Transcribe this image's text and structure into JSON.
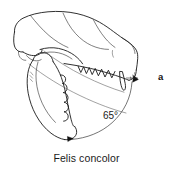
{
  "figure": {
    "panel_label": "a",
    "caption": "Felis concolor",
    "angle_label": "65°",
    "angle_value": 65,
    "angle_unit": "degrees",
    "colors": {
      "background": "#ffffff",
      "ink": "#1a1a1a",
      "ink_light": "#555555",
      "arc": "#3a3a3a",
      "text": "#1a1a1a"
    },
    "parts": [
      {
        "name": "cranium",
        "label": "cranium"
      },
      {
        "name": "rostrum",
        "label": "rostrum"
      },
      {
        "name": "upper-tooth-row",
        "label": "upper tooth row"
      },
      {
        "name": "upper-canine",
        "label": "upper canine"
      },
      {
        "name": "mandible",
        "label": "mandible"
      },
      {
        "name": "lower-tooth-row",
        "label": "lower tooth row"
      },
      {
        "name": "coronoid-process",
        "label": "coronoid process"
      },
      {
        "name": "gape-angle-arc",
        "label": "gape angle arc"
      }
    ]
  }
}
